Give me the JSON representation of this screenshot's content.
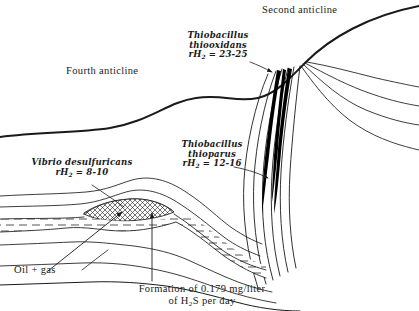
{
  "figure": {
    "type": "geological-cross-section",
    "background_color": "#ffffff",
    "ink_color": "#1a1a1a",
    "fill_black": "#000000"
  },
  "labels": {
    "fourth_anticline": "Fourth anticline",
    "second_anticline": "Second anticline",
    "oil_gas": "Oil + gas"
  },
  "annotations": {
    "thiooxidans": {
      "genus": "Thiobacillus",
      "species": "thiooxidans",
      "rh2_prefix": "rH",
      "rh2_sub": "2",
      "rh2_value": "= 23-25",
      "rh2_range": "23-25"
    },
    "thioparus": {
      "genus": "Thiobacillus",
      "species": "thioparus",
      "rh2_prefix": "rH",
      "rh2_sub": "2",
      "rh2_value": "= 12-16",
      "rh2_range": "12-16"
    },
    "desulfuricans": {
      "genus": "Vibrio",
      "species": "desulfuricans",
      "rh2_prefix": "rH",
      "rh2_sub": "2",
      "rh2_value": "= 8-10",
      "rh2_range": "8-10"
    },
    "formation": {
      "line1": "Formation of 0.179 mg/liter",
      "line2_pre": "of H",
      "line2_sub": "2",
      "line2_post": "S per day",
      "rate_value": "0.179",
      "rate_units": "mg/liter per day",
      "compound": "H2S"
    }
  }
}
